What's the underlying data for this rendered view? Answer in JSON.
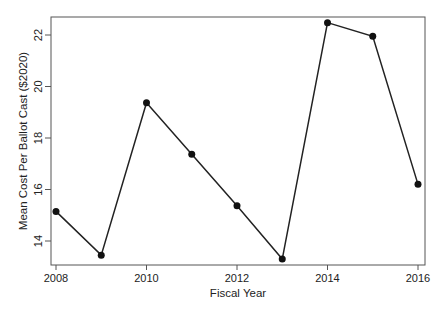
{
  "chart_data": {
    "type": "line",
    "title": "",
    "xlabel": "Fiscal Year",
    "ylabel": "Mean Cost Per Ballot Cast ($2020)",
    "x": [
      2008,
      2009,
      2010,
      2011,
      2012,
      2013,
      2014,
      2015,
      2016
    ],
    "series": [
      {
        "name": "Mean Cost Per Ballot Cast",
        "values": [
          15.15,
          13.45,
          19.37,
          17.37,
          15.37,
          13.3,
          22.48,
          21.95,
          16.2
        ]
      }
    ],
    "xticks": [
      2008,
      2010,
      2012,
      2014,
      2016
    ],
    "yticks": [
      14,
      16,
      18,
      20,
      22
    ],
    "xlim": [
      2007.88,
      2016.17
    ],
    "ylim": [
      13.05,
      22.7
    ],
    "grid": false,
    "legend": "none",
    "markers": "filled-circle",
    "line_color": "#222222"
  }
}
